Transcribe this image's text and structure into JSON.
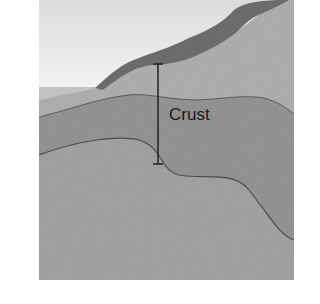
{
  "diagram": {
    "labels": {
      "crust": "Crust"
    },
    "colors": {
      "sky": "#e6e6e6",
      "sea": "#bdbdbd",
      "crust_band": "#9a9a9a",
      "mantle": "#a8a8a8",
      "land": "#b0b0b0",
      "mountain": "#6e6e6e",
      "line": "#2a2a2a"
    }
  }
}
